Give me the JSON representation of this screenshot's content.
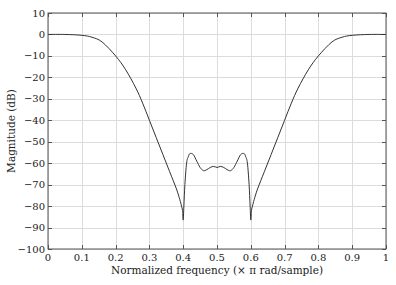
{
  "chart_data": {
    "type": "line",
    "title": "",
    "xlabel": "Normalized frequency (× π rad/sample)",
    "ylabel": "Magnitude (dB)",
    "xlim": [
      0,
      1
    ],
    "ylim": [
      -100,
      10
    ],
    "xticks": [
      0,
      0.1,
      0.2,
      0.3,
      0.4,
      0.5,
      0.6,
      0.7,
      0.8,
      0.9,
      1
    ],
    "xtick_labels": [
      "0",
      "0.1",
      "0.2",
      "0.3",
      "0.4",
      "0.5",
      "0.6",
      "0.7",
      "0.8",
      "0.9",
      "1"
    ],
    "yticks": [
      10,
      0,
      -10,
      -20,
      -30,
      -40,
      -50,
      -60,
      -70,
      -80,
      -90,
      -100
    ],
    "ytick_labels": [
      "10",
      "0",
      "−10",
      "−20",
      "−30",
      "−40",
      "−50",
      "−60",
      "−70",
      "−80",
      "−90",
      "−100"
    ],
    "grid": true,
    "legend": null,
    "series": [
      {
        "name": "Magnitude response (bandstop)",
        "color": "#333333",
        "x": [
          0,
          0.05,
          0.1,
          0.13,
          0.16,
          0.2,
          0.23,
          0.26,
          0.28,
          0.3,
          0.32,
          0.34,
          0.36,
          0.38,
          0.39,
          0.395,
          0.398,
          0.4,
          0.402,
          0.405,
          0.41,
          0.415,
          0.42,
          0.43,
          0.44,
          0.45,
          0.46,
          0.47,
          0.48,
          0.49,
          0.5,
          0.51,
          0.52,
          0.53,
          0.54,
          0.55,
          0.56,
          0.57,
          0.58,
          0.585,
          0.59,
          0.595,
          0.598,
          0.6,
          0.602,
          0.605,
          0.61,
          0.62,
          0.64,
          0.66,
          0.68,
          0.7,
          0.72,
          0.74,
          0.77,
          0.8,
          0.84,
          0.87,
          0.9,
          0.95,
          1
        ],
        "values": [
          0,
          0,
          -0.4,
          -1.3,
          -3.5,
          -10,
          -16.5,
          -25,
          -32,
          -40,
          -48,
          -56,
          -64,
          -72,
          -77,
          -80,
          -82,
          -86.5,
          -80,
          -70,
          -60,
          -57,
          -55.5,
          -56,
          -59,
          -62,
          -63.5,
          -63,
          -62,
          -61.5,
          -62,
          -61.5,
          -62,
          -63,
          -63.5,
          -62,
          -59,
          -56,
          -55.5,
          -57,
          -60,
          -70,
          -80,
          -86.5,
          -82,
          -80,
          -77,
          -72,
          -64,
          -56,
          -48,
          -40,
          -32,
          -25,
          -16.5,
          -10,
          -3.5,
          -1.3,
          -0.4,
          0,
          0
        ]
      }
    ]
  }
}
